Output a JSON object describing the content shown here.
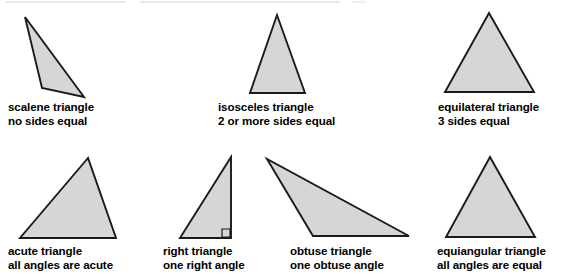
{
  "figure": {
    "background_color": "#ffffff",
    "fill_color": "#d6d6d6",
    "stroke_color": "#1a1a1a",
    "text_color": "#000000",
    "triangles": [
      {
        "id": "scalene",
        "name_line1": "scalene triangle",
        "name_line2": "no sides equal",
        "points": "25,17 42,88 84,97",
        "caption_left": 8,
        "caption_top": 100,
        "has_right_angle_mark": false
      },
      {
        "id": "isosceles",
        "name_line1": "isosceles triangle",
        "name_line2": "2 or more sides equal",
        "points": "277,15 250,93 305,93",
        "caption_left": 218,
        "caption_top": 100,
        "has_right_angle_mark": false
      },
      {
        "id": "equilateral",
        "name_line1": "equilateral triangle",
        "name_line2": "3 sides equal",
        "points": "489,13 445,92 534,92",
        "caption_left": 438,
        "caption_top": 100,
        "has_right_angle_mark": false
      },
      {
        "id": "acute",
        "name_line1": "acute triangle",
        "name_line2": "all angles are acute",
        "points": "88,158 20,238 116,238",
        "caption_left": 8,
        "caption_top": 244,
        "has_right_angle_mark": false
      },
      {
        "id": "right",
        "name_line1": "right triangle",
        "name_line2": "one right angle",
        "points": "231,157 180,238 231,238",
        "caption_left": 163,
        "caption_top": 244,
        "has_right_angle_mark": true,
        "right_angle_mark": "222,229 230,229 230,237 222,237"
      },
      {
        "id": "obtuse",
        "name_line1": "obtuse triangle",
        "name_line2": "one obtuse angle",
        "points": "267,159 313,236 409,236",
        "caption_left": 290,
        "caption_top": 244,
        "has_right_angle_mark": false
      },
      {
        "id": "equiangular",
        "name_line1": "equiangular triangle",
        "name_line2": "all angles are equal",
        "points": "490,157 446,237 535,237",
        "caption_left": 437,
        "caption_top": 244,
        "has_right_angle_mark": false
      }
    ]
  }
}
